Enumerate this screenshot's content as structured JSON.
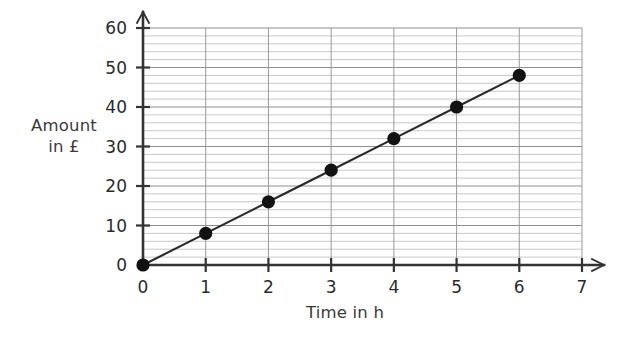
{
  "chart_data": {
    "type": "line",
    "title": "",
    "subtitle": "",
    "xlabel": "Time in h",
    "ylabel": "Amount\nin £",
    "ylabel_lines": [
      "Amount",
      "in £"
    ],
    "x": [
      0,
      1,
      2,
      3,
      4,
      5,
      6
    ],
    "values": [
      0,
      8,
      16,
      24,
      32,
      40,
      48
    ],
    "series": [
      {
        "name": "Amount",
        "x": [
          0,
          1,
          2,
          3,
          4,
          5,
          6
        ],
        "values": [
          0,
          8,
          16,
          24,
          32,
          40,
          48
        ]
      }
    ],
    "xlim": [
      0,
      7
    ],
    "ylim": [
      0,
      60
    ],
    "xticks": [
      0,
      1,
      2,
      3,
      4,
      5,
      6,
      7
    ],
    "xtick_labels": [
      "0",
      "1",
      "2",
      "3",
      "4",
      "5",
      "6",
      "7"
    ],
    "yticks": [
      0,
      10,
      20,
      30,
      40,
      50,
      60
    ],
    "ytick_labels": [
      "0",
      "10",
      "20",
      "30",
      "40",
      "50",
      "60"
    ],
    "y_minor_step": 2,
    "x_minor_step": 1,
    "grid": true,
    "grid_horizontal": true,
    "grid_vertical": true,
    "legend": false,
    "legend_position": "none",
    "slope": 8,
    "slope_units": "£ per h",
    "marker": "filled-circle",
    "annotations": []
  },
  "style": {
    "background": "#ffffff",
    "axis_color": "#333333",
    "line_color": "#2a2a2a",
    "marker_color": "#121212",
    "grid_major_color": "#8c8c8c",
    "grid_minor_color": "#c9c9c9",
    "tick_label_color": "#2b2b2b",
    "axis_title_color": "#3a3a3a"
  }
}
